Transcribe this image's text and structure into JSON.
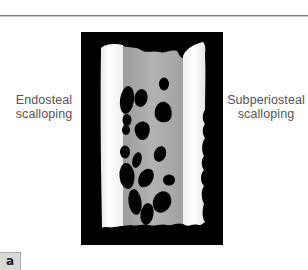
{
  "figure": {
    "panel_label": "a",
    "labels": {
      "left": [
        "Endosteal",
        "scalloping"
      ],
      "right": [
        "Subperiosteal",
        "scalloping"
      ]
    },
    "colors": {
      "background": "#000000",
      "cortex": "#f4f4f4",
      "medulla": "#a9a9a9",
      "cavities": "#000000",
      "label_text": "#555555",
      "rule": "#7a7a7a",
      "panel_box": "#d9d9d9"
    }
  }
}
